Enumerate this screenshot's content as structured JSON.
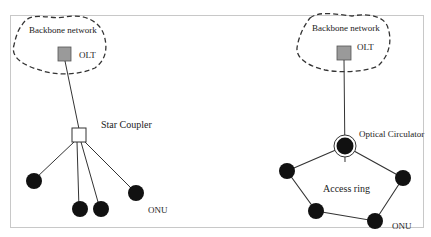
{
  "diagram": {
    "left": {
      "backbone_label": "Backbone network",
      "olt_label": "OLT",
      "coupler_label": "Star Coupler",
      "onu_label": "ONU"
    },
    "right": {
      "backbone_label": "Backbone network",
      "olt_label": "OLT",
      "circulator_label": "Optical Circulator",
      "ring_label": "Access ring",
      "onu_label": "ONU"
    },
    "colors": {
      "frame": "#c8c8c8",
      "olt_fill": "#9a9a9a",
      "node_fill": "#111111",
      "line": "#333333",
      "background": "#ffffff"
    }
  }
}
